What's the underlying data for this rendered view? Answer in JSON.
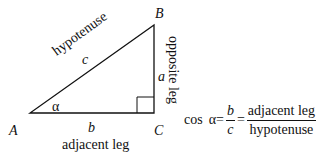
{
  "diagram": {
    "vertices": {
      "A": "A",
      "B": "B",
      "C": "C"
    },
    "sides": {
      "hypotenuse_var": "c",
      "opposite_var": "a",
      "adjacent_var": "b"
    },
    "side_labels": {
      "hypotenuse": "hypotenuse",
      "opposite": "opposite leg",
      "adjacent": "adjacent leg"
    },
    "angle": "α"
  },
  "formula": {
    "func": "cos",
    "angle": "α",
    "eq1": "=",
    "ratio_num": "b",
    "ratio_den": "c",
    "eq2": "=",
    "word_num": "adjacent leg",
    "word_den": "hypotenuse"
  }
}
